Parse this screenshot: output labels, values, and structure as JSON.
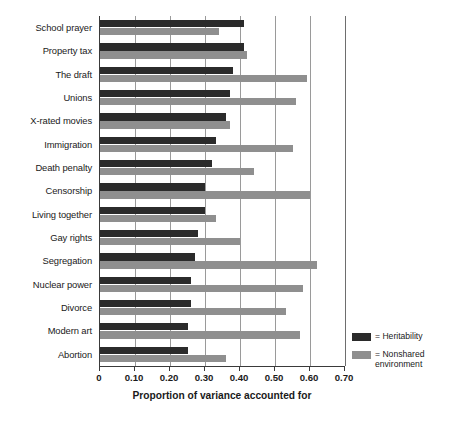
{
  "chart_data": {
    "type": "bar",
    "orientation": "horizontal",
    "title": "",
    "xlabel": "Proportion of variance accounted for",
    "ylabel": "",
    "xlim": [
      0,
      0.7
    ],
    "xticks": [
      "0",
      "0.10",
      "0.20",
      "0.30",
      "0.40",
      "0.50",
      "0.60",
      "0.70"
    ],
    "xtick_values": [
      0,
      0.1,
      0.2,
      0.3,
      0.4,
      0.5,
      0.6,
      0.7
    ],
    "grid": "vertical",
    "legend_position": "right-bottom",
    "categories": [
      "School prayer",
      "Property tax",
      "The draft",
      "Unions",
      "X-rated movies",
      "Immigration",
      "Death penalty",
      "Censorship",
      "Living together",
      "Gay rights",
      "Segregation",
      "Nuclear power",
      "Divorce",
      "Modern art",
      "Abortion"
    ],
    "series": [
      {
        "name": "Heritability",
        "color": "#2b2b2b",
        "values": [
          0.41,
          0.41,
          0.38,
          0.37,
          0.36,
          0.33,
          0.32,
          0.3,
          0.3,
          0.28,
          0.27,
          0.26,
          0.26,
          0.25,
          0.25
        ]
      },
      {
        "name": "Nonshared environment",
        "color": "#8f8f8f",
        "values": [
          0.34,
          0.42,
          0.59,
          0.56,
          0.37,
          0.55,
          0.44,
          0.6,
          0.33,
          0.4,
          0.62,
          0.58,
          0.53,
          0.57,
          0.36
        ]
      }
    ]
  },
  "legend": {
    "entries": [
      {
        "label": "= Heritability",
        "swatch": "heritability"
      },
      {
        "label": "= Nonshared\nenvironment",
        "swatch": "nonshared"
      }
    ]
  },
  "colors": {
    "heritability": "#2b2b2b",
    "nonshared": "#8f8f8f",
    "axis": "#3a3a3a",
    "gridline": "#9a9a9a",
    "background": "#ffffff"
  }
}
